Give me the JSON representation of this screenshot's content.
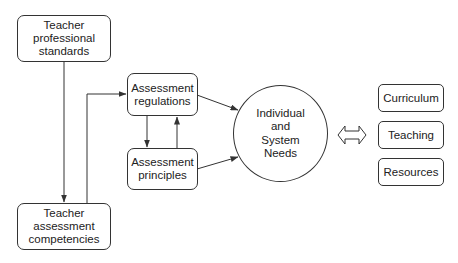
{
  "diagram": {
    "nodes": {
      "teacher_standards": {
        "lines": [
          "Teacher",
          "professional",
          "standards"
        ]
      },
      "teacher_competencies": {
        "lines": [
          "Teacher",
          "assessment",
          "competencies"
        ]
      },
      "assessment_regulations": {
        "lines": [
          "Assessment",
          "regulations"
        ]
      },
      "assessment_principles": {
        "lines": [
          "Assessment",
          "principles"
        ]
      },
      "needs": {
        "lines": [
          "Individual",
          "and",
          "System",
          "Needs"
        ]
      },
      "curriculum": {
        "lines": [
          "Curriculum"
        ]
      },
      "teaching": {
        "lines": [
          "Teaching"
        ]
      },
      "resources": {
        "lines": [
          "Resources"
        ]
      }
    },
    "edges": [
      {
        "from": "Teacher professional standards",
        "to": "Teacher assessment competencies"
      },
      {
        "from": "Teacher assessment competencies",
        "to": "Assessment regulations"
      },
      {
        "from": "Assessment regulations",
        "to": "Assessment principles"
      },
      {
        "from": "Assessment principles",
        "to": "Assessment regulations"
      },
      {
        "from": "Assessment regulations",
        "to": "Individual and System Needs"
      },
      {
        "from": "Assessment principles",
        "to": "Individual and System Needs"
      },
      {
        "from": "Individual and System Needs",
        "to": "Curriculum / Teaching / Resources",
        "type": "bidirectional"
      }
    ],
    "colors": {
      "stroke": "#333333",
      "fill": "#ffffff",
      "text": "#222222"
    }
  }
}
